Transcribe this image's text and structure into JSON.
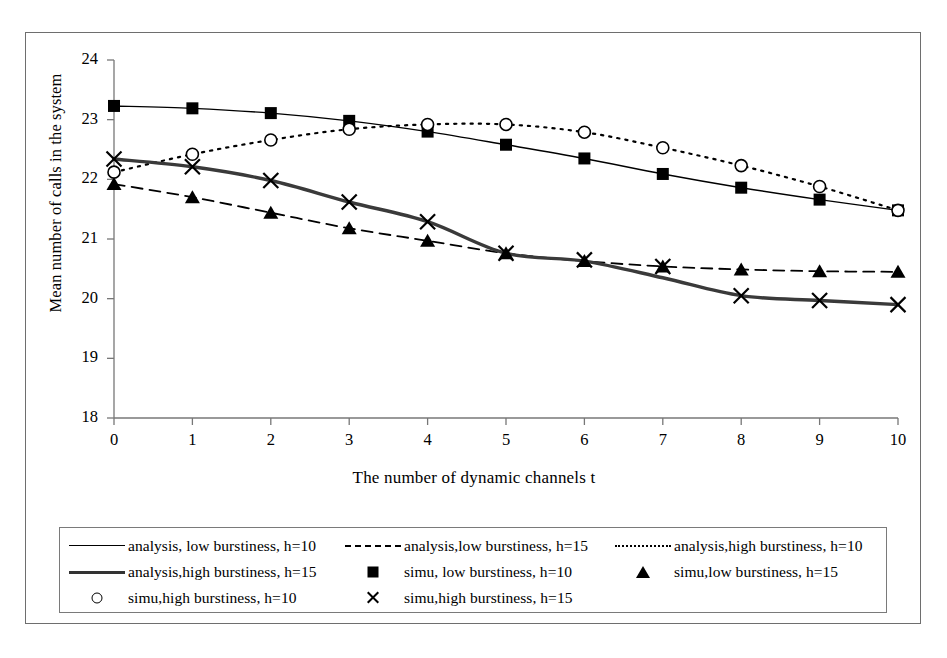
{
  "chart_data": {
    "type": "line",
    "title": "",
    "xlabel": "The number of dynamic channels t",
    "ylabel": "Mean number of calls in the system",
    "x": [
      0,
      1,
      2,
      3,
      4,
      5,
      6,
      7,
      8,
      9,
      10
    ],
    "xtick_labels": [
      "0",
      "1",
      "2",
      "3",
      "4",
      "5",
      "6",
      "7",
      "8",
      "9",
      "10"
    ],
    "ytick_labels": [
      "24",
      "23",
      "22",
      "21",
      "20",
      "19",
      "18"
    ],
    "xlim": [
      0,
      10
    ],
    "ylim": [
      18,
      24
    ],
    "grid": false,
    "legend_position": "bottom",
    "series": [
      {
        "name": "analysis, low burstiness, h=10",
        "style": "solid-thin",
        "marker": "none",
        "values": [
          23.23,
          23.19,
          23.11,
          22.98,
          22.8,
          22.58,
          22.35,
          22.09,
          21.86,
          21.66,
          21.48
        ]
      },
      {
        "name": "analysis,low burstiness, h=15",
        "style": "dashed",
        "marker": "none",
        "values": [
          21.92,
          21.7,
          21.44,
          21.18,
          20.97,
          20.76,
          20.63,
          20.54,
          20.49,
          20.46,
          20.45
        ]
      },
      {
        "name": "analysis,high burstiness, h=10",
        "style": "dotted",
        "marker": "none",
        "values": [
          22.12,
          22.42,
          22.66,
          22.84,
          22.92,
          22.92,
          22.79,
          22.53,
          22.23,
          21.88,
          21.48
        ]
      },
      {
        "name": "analysis,high burstiness, h=15",
        "style": "solid-thick",
        "marker": "none",
        "values": [
          22.34,
          22.21,
          21.98,
          21.62,
          21.29,
          20.76,
          20.63,
          20.35,
          20.05,
          19.97,
          19.9
        ]
      },
      {
        "name": "simu, low burstiness, h=10",
        "style": "none",
        "marker": "square",
        "values": [
          23.23,
          23.19,
          23.11,
          22.98,
          22.8,
          22.58,
          22.35,
          22.09,
          21.86,
          21.66,
          21.48
        ]
      },
      {
        "name": "simu,low burstiness, h=15",
        "style": "none",
        "marker": "triangle",
        "values": [
          21.92,
          21.7,
          21.44,
          21.18,
          20.97,
          20.76,
          20.63,
          20.54,
          20.49,
          20.46,
          20.45
        ]
      },
      {
        "name": "simu,high burstiness, h=10",
        "style": "none",
        "marker": "circle",
        "values": [
          22.12,
          22.42,
          22.66,
          22.84,
          22.92,
          22.92,
          22.79,
          22.53,
          22.23,
          21.88,
          21.48
        ]
      },
      {
        "name": "simu,high burstiness, h=15",
        "style": "none",
        "marker": "cross",
        "values": [
          22.34,
          22.21,
          21.98,
          21.62,
          21.29,
          20.76,
          20.65,
          20.54,
          20.05,
          19.97,
          19.9
        ]
      }
    ]
  },
  "legend": {
    "rows": [
      [
        {
          "label": "analysis, low burstiness, h=10",
          "sample": "solid-thin"
        },
        {
          "label": "analysis,low burstiness, h=15",
          "sample": "dashed"
        },
        {
          "label": "analysis,high burstiness, h=10",
          "sample": "dotted"
        }
      ],
      [
        {
          "label": "analysis,high burstiness, h=15",
          "sample": "solid-thick"
        },
        {
          "label": "simu, low burstiness, h=10",
          "sample": "square"
        },
        {
          "label": "simu,low burstiness, h=15",
          "sample": "triangle"
        }
      ],
      [
        {
          "label": "simu,high burstiness, h=10",
          "sample": "circle"
        },
        {
          "label": "simu,high burstiness, h=15",
          "sample": "cross"
        }
      ]
    ]
  }
}
